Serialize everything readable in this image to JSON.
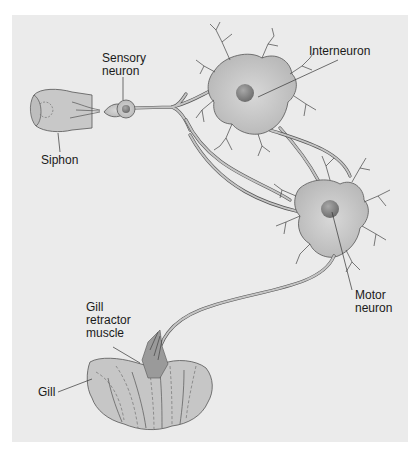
{
  "figure": {
    "background_color": "#ebebeb",
    "cell_color": "#c4c4c4",
    "nucleus_color": "#8a8a8a",
    "outline_color": "#555555"
  },
  "labels": {
    "sensory_neuron": "Sensory\nneuron",
    "interneuron": "Interneuron",
    "siphon": "Siphon",
    "motor_neuron": "Motor\nneuron",
    "gill_retractor_muscle": "Gill\nretractor\nmuscle",
    "gill": "Gill"
  }
}
